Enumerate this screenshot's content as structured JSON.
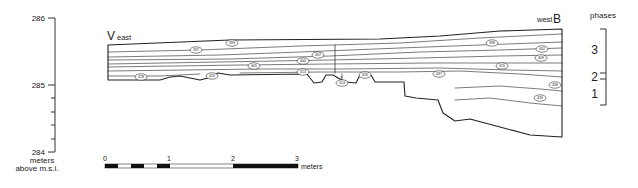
{
  "axis": {
    "ticks": [
      {
        "label": "286",
        "y": 18
      },
      {
        "label": "285",
        "y": 85
      },
      {
        "label": "284",
        "y": 152
      }
    ],
    "unit_line1": "meters",
    "unit_line2": "above m.s.l."
  },
  "section": {
    "left_label_letter": "V",
    "left_label_dir": "east",
    "right_label_dir": "west",
    "right_label_letter": "B",
    "layer_labels": [
      {
        "text": "399",
        "x": 232,
        "y": 43
      },
      {
        "text": "397",
        "x": 196,
        "y": 50
      },
      {
        "text": "407",
        "x": 318,
        "y": 55
      },
      {
        "text": "400",
        "x": 303,
        "y": 61
      },
      {
        "text": "405",
        "x": 254,
        "y": 66
      },
      {
        "text": "413",
        "x": 303,
        "y": 72
      },
      {
        "text": "418",
        "x": 141,
        "y": 77
      },
      {
        "text": "420",
        "x": 212,
        "y": 76
      },
      {
        "text": "414",
        "x": 342,
        "y": 83
      },
      {
        "text": "426",
        "x": 365,
        "y": 75
      },
      {
        "text": "398",
        "x": 492,
        "y": 43
      },
      {
        "text": "402",
        "x": 542,
        "y": 49
      },
      {
        "text": "409",
        "x": 541,
        "y": 58
      },
      {
        "text": "415",
        "x": 502,
        "y": 66
      },
      {
        "text": "437",
        "x": 439,
        "y": 74
      },
      {
        "text": "438",
        "x": 555,
        "y": 85
      },
      {
        "text": "439",
        "x": 540,
        "y": 98
      }
    ],
    "marker_label": "1"
  },
  "phases": {
    "title": "phases",
    "items": [
      {
        "label": "3",
        "y": 50
      },
      {
        "label": "2",
        "y": 76
      },
      {
        "label": "1",
        "y": 94
      }
    ]
  },
  "scale_bar": {
    "ticks": [
      "0",
      "1",
      "2",
      "3"
    ],
    "unit": "meters"
  }
}
